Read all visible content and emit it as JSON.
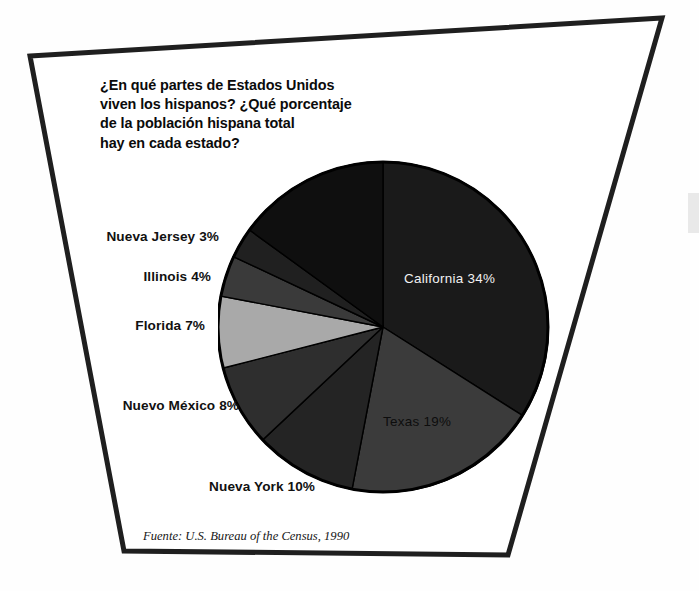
{
  "figure": {
    "question": "¿En qué partes de Estados Unidos\nviven los hispanos? ¿Qué porcentaje\nde la población hispana total\nhay en cada estado?",
    "source_note": "Fuente: U.S. Bureau of the Census, 1990"
  },
  "chart_data": {
    "type": "pie",
    "title": "¿En qué partes de Estados Unidos viven los hispanos? ¿Qué porcentaje de la población hispana total hay en cada estado?",
    "xlabel": "",
    "ylabel": "",
    "units": "percent",
    "legend_position": "none",
    "grid": false,
    "annotations": [
      "Fuente: U.S. Bureau of the Census, 1990"
    ],
    "categories": [
      "California",
      "Texas",
      "Nueva York",
      "Nuevo México",
      "Florida",
      "Illinois",
      "Nueva Jersey",
      "Otros estados"
    ],
    "values": [
      34,
      19,
      10,
      8,
      7,
      4,
      3,
      15
    ],
    "slices": [
      {
        "name": "California",
        "value": 34,
        "label": "California 34%",
        "color": "#1a1a1a",
        "label_color": "#f2f2f2",
        "label_placement": "inside",
        "label_x": 404,
        "label_y": 271
      },
      {
        "name": "Texas",
        "value": 19,
        "label": "Texas 19%",
        "color": "#3b3b3b",
        "label_color": "#0d0d0d",
        "label_placement": "inside",
        "label_x": 383,
        "label_y": 414
      },
      {
        "name": "Nueva York",
        "value": 10,
        "label": "Nueva York 10%",
        "color": "#242424",
        "label_color": "#111111",
        "label_placement": "outside-left",
        "label_x": 175,
        "label_y": 479
      },
      {
        "name": "Nuevo México",
        "value": 8,
        "label": "Nuevo México 8%",
        "color": "#2e2e2e",
        "label_color": "#111111",
        "label_placement": "outside-left",
        "label_x": 106,
        "label_y": 398
      },
      {
        "name": "Florida",
        "value": 7,
        "label": "Florida 7%",
        "color": "#a9a9a9",
        "label_color": "#111111",
        "label_placement": "outside-left",
        "label_x": 122,
        "label_y": 318
      },
      {
        "name": "Illinois",
        "value": 4,
        "label": "Illinois 4%",
        "color": "#3a3a3a",
        "label_color": "#111111",
        "label_placement": "outside-left",
        "label_x": 134,
        "label_y": 269
      },
      {
        "name": "Nueva Jersey",
        "value": 3,
        "label": "Nueva Jersey 3%",
        "color": "#202020",
        "label_color": "#111111",
        "label_placement": "outside-left",
        "label_x": 116,
        "label_y": 229
      },
      {
        "name": "Otros estados",
        "value": 15,
        "label": "",
        "color": "#0f0f0f",
        "label_color": "#0f0f0f",
        "label_placement": "none",
        "label_x": 0,
        "label_y": 0
      }
    ],
    "geometry": {
      "center_x": 383,
      "center_y": 327,
      "radius": 166,
      "start_angle_deg": -90,
      "direction": "clockwise"
    }
  },
  "labels": {
    "nueva_jersey": "Nueva Jersey 3%",
    "illinois": "Illinois 4%",
    "florida": "Florida 7%",
    "nuevo_mexico": "Nuevo México 8%",
    "nueva_york": "Nueva York 10%",
    "california": "California 34%",
    "texas": "Texas 19%"
  },
  "colors": {
    "frame": "#1c1c1c",
    "background": "#ffffff",
    "pie_outline": "#000000",
    "highlight_slice": "#a9a9a9"
  }
}
